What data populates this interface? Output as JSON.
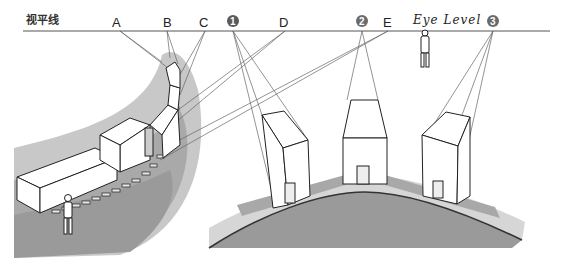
{
  "diagram": {
    "horizon_label_cn": "视平线",
    "horizon_label_en": "Eye Level",
    "vanishing_point_letters": [
      "A",
      "B",
      "C",
      "D",
      "E"
    ],
    "vanishing_point_numbers": [
      "1",
      "2",
      "3"
    ],
    "left_scene": "train on curved track with figure",
    "right_scene": "three buildings on curved street",
    "colors": {
      "ground_dark": "#9a9a9a",
      "ground_light": "#c4c4c4",
      "road_light": "#d6d6d6",
      "line": "#222222",
      "marker": "#6a6a6a"
    }
  }
}
